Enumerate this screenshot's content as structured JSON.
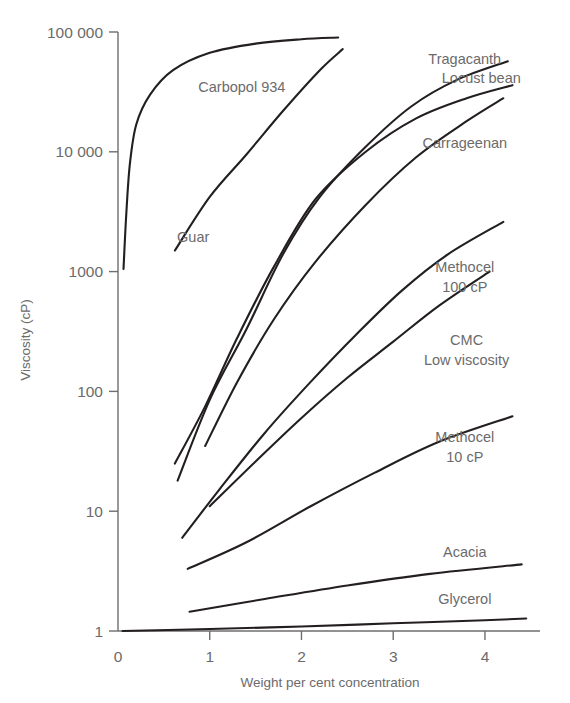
{
  "chart_data": {
    "type": "line",
    "title": "",
    "xlabel": "Weight per cent concentration",
    "ylabel": "Viscosity (cP)",
    "yscale": "log",
    "xlim": [
      0,
      4.6
    ],
    "ylim": [
      1,
      100000
    ],
    "grid": false,
    "legend_position": "inline-labels",
    "x_ticks": [
      "0",
      "1",
      "2",
      "3",
      "4"
    ],
    "x_tick_values": [
      0,
      1,
      2,
      3,
      4
    ],
    "y_ticks": [
      "1",
      "10",
      "100",
      "1000",
      "10 000",
      "100 000"
    ],
    "y_tick_values": [
      1,
      10,
      100,
      1000,
      10000,
      100000
    ],
    "series": [
      {
        "name": "Carbopol 934",
        "label": "Carbopol 934",
        "label_x": 1.35,
        "label_y_px": 92,
        "points": [
          [
            0.06,
            1050
          ],
          [
            0.09,
            3000
          ],
          [
            0.13,
            8000
          ],
          [
            0.2,
            17000
          ],
          [
            0.35,
            30000
          ],
          [
            0.6,
            48000
          ],
          [
            1.0,
            67000
          ],
          [
            1.5,
            80000
          ],
          [
            2.0,
            87000
          ],
          [
            2.4,
            90000
          ]
        ]
      },
      {
        "name": "Guar",
        "label": "Guar",
        "label_x": 0.82,
        "label_y_px": 242,
        "points": [
          [
            0.62,
            1500
          ],
          [
            1.0,
            4200
          ],
          [
            1.4,
            9500
          ],
          [
            1.8,
            22000
          ],
          [
            2.2,
            48000
          ],
          [
            2.45,
            72000
          ]
        ]
      },
      {
        "name": "Tragacanth",
        "label": "Tragacanth",
        "label_x": 3.78,
        "label_y_px": 64,
        "points": [
          [
            0.65,
            18
          ],
          [
            1.0,
            85
          ],
          [
            1.4,
            330
          ],
          [
            1.8,
            1400
          ],
          [
            2.2,
            4200
          ],
          [
            2.7,
            11000
          ],
          [
            3.2,
            24000
          ],
          [
            3.7,
            40000
          ],
          [
            4.25,
            57000
          ]
        ]
      },
      {
        "name": "Locust bean",
        "label": "Locust bean",
        "label_x": 3.96,
        "label_y_px": 83,
        "points": [
          [
            0.62,
            25
          ],
          [
            0.95,
            75
          ],
          [
            1.3,
            280
          ],
          [
            1.7,
            1100
          ],
          [
            2.15,
            4000
          ],
          [
            2.7,
            10000
          ],
          [
            3.25,
            19000
          ],
          [
            3.8,
            28000
          ],
          [
            4.3,
            36000
          ]
        ]
      },
      {
        "name": "Carrageenan",
        "label": "Carrageenan",
        "label_x": 3.78,
        "label_y_px": 148,
        "points": [
          [
            0.95,
            35
          ],
          [
            1.3,
            120
          ],
          [
            1.7,
            400
          ],
          [
            2.15,
            1200
          ],
          [
            2.7,
            3600
          ],
          [
            3.25,
            9000
          ],
          [
            3.8,
            18000
          ],
          [
            4.2,
            28000
          ]
        ]
      },
      {
        "name": "Methocel 100 cP",
        "label": "Methocel",
        "label2": "100 cP",
        "label_x": 3.78,
        "label_y_px": 272,
        "label2_y_px": 292,
        "points": [
          [
            0.7,
            6
          ],
          [
            1.1,
            15
          ],
          [
            1.6,
            45
          ],
          [
            2.1,
            120
          ],
          [
            2.6,
            300
          ],
          [
            3.1,
            700
          ],
          [
            3.6,
            1400
          ],
          [
            4.2,
            2600
          ]
        ]
      },
      {
        "name": "CMC Low viscosity",
        "label": "CMC",
        "label2": "Low viscosity",
        "label_x": 3.8,
        "label_y_px": 345,
        "label2_y_px": 365,
        "points": [
          [
            1.0,
            11
          ],
          [
            1.5,
            26
          ],
          [
            2.0,
            60
          ],
          [
            2.5,
            130
          ],
          [
            3.0,
            260
          ],
          [
            3.5,
            520
          ],
          [
            4.05,
            1000
          ]
        ]
      },
      {
        "name": "Methocel 10 cP",
        "label": "Methocel",
        "label2": "10 cP",
        "label_x": 3.78,
        "label_y_px": 442,
        "label2_y_px": 462,
        "points": [
          [
            0.76,
            3.3
          ],
          [
            1.4,
            5.5
          ],
          [
            2.1,
            11
          ],
          [
            2.8,
            21
          ],
          [
            3.5,
            38
          ],
          [
            4.3,
            62
          ]
        ]
      },
      {
        "name": "Acacia",
        "label": "Acacia",
        "label_x": 3.78,
        "label_y_px": 557,
        "points": [
          [
            0.78,
            1.45
          ],
          [
            1.6,
            1.85
          ],
          [
            2.5,
            2.4
          ],
          [
            3.4,
            3.0
          ],
          [
            4.4,
            3.6
          ]
        ]
      },
      {
        "name": "Glycerol",
        "label": "Glycerol",
        "label_x": 3.78,
        "label_y_px": 604,
        "points": [
          [
            0.05,
            1.0
          ],
          [
            1.0,
            1.04
          ],
          [
            2.0,
            1.09
          ],
          [
            3.0,
            1.16
          ],
          [
            4.0,
            1.23
          ],
          [
            4.45,
            1.27
          ]
        ]
      }
    ]
  }
}
